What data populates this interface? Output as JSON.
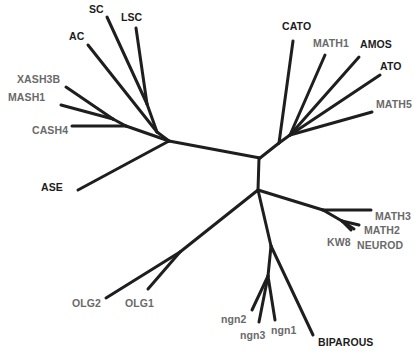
{
  "diagram": {
    "type": "unrooted phylogenetic tree",
    "colors": {
      "branch": "#1e1e1e",
      "label_dark": "#1c1c1c",
      "label_gray": "#6a6a6a",
      "background": "#ffffff"
    },
    "labels": {
      "sc": "SC",
      "lsc": "LSC",
      "ac": "AC",
      "xash3b": "XASH3B",
      "mash1": "MASH1",
      "cash4": "CASH4",
      "ase": "ASE",
      "cato": "CATO",
      "math1": "MATH1",
      "amos": "AMOS",
      "ato": "ATO",
      "math5": "MATH5",
      "math3": "MATH3",
      "math2": "MATH2",
      "kw8": "KW8",
      "neurod": "NEUROD",
      "olg2": "OLG2",
      "olg1": "OLG1",
      "ngn2": "ngn2",
      "ngn3": "ngn3",
      "ngn1": "ngn1",
      "biparous": "BIPAROUS"
    },
    "clades": [
      {
        "name": "achaete-scute",
        "members": [
          "SC",
          "LSC",
          "AC",
          "XASH3B",
          "MASH1",
          "CASH4",
          "ASE"
        ]
      },
      {
        "name": "atonal",
        "members": [
          "CATO",
          "MATH1",
          "AMOS",
          "ATO",
          "MATH5"
        ]
      },
      {
        "name": "neurod",
        "members": [
          "MATH3",
          "MATH2",
          "KW8",
          "NEUROD"
        ]
      },
      {
        "name": "olig",
        "members": [
          "OLG2",
          "OLG1"
        ]
      },
      {
        "name": "neurogenin",
        "members": [
          "ngn2",
          "ngn3",
          "ngn1",
          "BIPAROUS"
        ]
      }
    ]
  }
}
